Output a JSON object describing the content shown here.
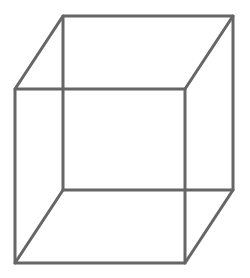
{
  "diagram": {
    "type": "wireframe-cube",
    "stroke_color": "#666666",
    "background": "#ffffff",
    "stroke_width": 3,
    "vertices": {
      "front_top_left": [
        15,
        89
      ],
      "front_top_right": [
        185,
        89
      ],
      "front_bottom_left": [
        15,
        263
      ],
      "front_bottom_right": [
        185,
        263
      ],
      "back_top_left": [
        63,
        16
      ],
      "back_top_right": [
        233,
        16
      ],
      "back_bottom_left": [
        63,
        190
      ],
      "back_bottom_right": [
        233,
        190
      ]
    }
  }
}
